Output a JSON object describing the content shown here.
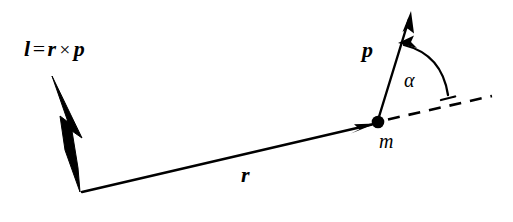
{
  "figure": {
    "background_color": "#ffffff",
    "stroke_color": "#000000",
    "width": 513,
    "height": 222
  },
  "labels": {
    "equation": {
      "lhs": "l",
      "equals": "=",
      "rhs_first": "r",
      "cross": "×",
      "rhs_second": "p"
    },
    "momentum": "p",
    "radius": "r",
    "mass": "m",
    "angle": "α"
  },
  "elements": {
    "angular_momentum_vector": {
      "name": "l",
      "style": "solid-filled-arrow",
      "from": [
        82,
        192
      ],
      "to": [
        52,
        76
      ]
    },
    "radius_vector": {
      "name": "r",
      "style": "thin-line-arrow",
      "from": [
        82,
        192
      ],
      "to": [
        374,
        124
      ]
    },
    "momentum_vector": {
      "name": "p",
      "style": "thin-line-arrow",
      "from": [
        378,
        122
      ],
      "to": [
        410,
        12
      ]
    },
    "mass_point": {
      "name": "m",
      "style": "filled-circle",
      "center": [
        378,
        122
      ],
      "radius": 6
    },
    "reference_dashed_line": {
      "style": "dashed",
      "from": [
        386,
        120
      ],
      "to": [
        492,
        96
      ]
    },
    "angle_arc": {
      "name": "α",
      "style": "double-headed-curved-arrow",
      "between": [
        "p",
        "reference_dashed_line"
      ]
    }
  }
}
